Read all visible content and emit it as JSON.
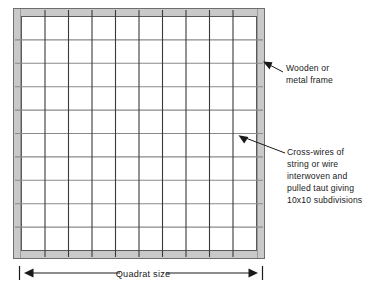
{
  "figure": {
    "type": "technical-diagram",
    "frame": {
      "band_color": "#c9c9c9",
      "band_outline_color": "#6e6e6e",
      "interior_color": "#ffffff"
    },
    "grid": {
      "columns": 10,
      "rows": 10,
      "interior_vertical_lines": 9,
      "interior_horizontal_lines": 9,
      "vertical_wire_color": "#3a3a3a",
      "horizontal_wire_color": "#8a8a8a"
    }
  },
  "annotations": [
    {
      "id": "frame-callout",
      "lines": [
        "Wooden or",
        "metal frame"
      ],
      "arrow": "arrow-up-left"
    },
    {
      "id": "wires-callout",
      "lines": [
        "Cross-wires of",
        "string or wire",
        "interwoven and",
        "pulled taut giving",
        "10x10 subdivisions"
      ],
      "arrow": "arrow-up-left"
    }
  ],
  "dimension": {
    "label": "Quadrat size",
    "style": "double-headed-arrow-with-end-ticks"
  }
}
